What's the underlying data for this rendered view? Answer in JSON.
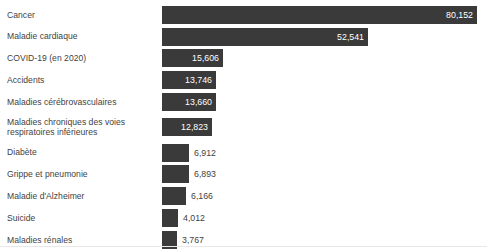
{
  "chart_data": {
    "type": "bar",
    "orientation": "horizontal",
    "title": "",
    "subtitle": "",
    "xlabel": "",
    "ylabel": "",
    "grid": false,
    "legend": null,
    "xlim": [
      0,
      80152
    ],
    "value_format": "comma-separated thousands",
    "bar_color": "#3a3a3a",
    "label_color": "#3f3f3f",
    "inside_label_color": "#ffffff",
    "categories": [
      "Cancer",
      "Maladie cardiaque",
      "COVID-19 (en 2020)",
      "Accidents",
      "Maladies cérébrovasculaires",
      "Maladies chroniques des voies\nrespiratoires inférieures",
      "Diabète",
      "Grippe et pneumonie",
      "Maladie d'Alzheimer",
      "Suicide",
      "Maladies rénales"
    ],
    "values": [
      80152,
      52541,
      15606,
      13746,
      13660,
      12823,
      6912,
      6893,
      6166,
      4012,
      3767
    ],
    "value_labels": [
      "80,152",
      "52,541",
      "15,606",
      "13,746",
      "13,660",
      "12,823",
      "6,912",
      "6,893",
      "6,166",
      "4,012",
      "3,767"
    ],
    "label_placement": [
      "inside",
      "inside",
      "inside",
      "inside",
      "inside",
      "inside",
      "outside",
      "outside",
      "outside",
      "outside",
      "outside"
    ]
  },
  "rows": [
    {
      "label": "Cancer",
      "value_label": "80,152",
      "value": 80152,
      "placement": "inside"
    },
    {
      "label": "Maladie cardiaque",
      "value_label": "52,541",
      "value": 52541,
      "placement": "inside"
    },
    {
      "label": "COVID-19 (en 2020)",
      "value_label": "15,606",
      "value": 15606,
      "placement": "inside"
    },
    {
      "label": "Accidents",
      "value_label": "13,746",
      "value": 13746,
      "placement": "inside"
    },
    {
      "label": "Maladies cérébrovasculaires",
      "value_label": "13,660",
      "value": 13660,
      "placement": "inside"
    },
    {
      "label": "Maladies chroniques des voies\nrespiratoires inférieures",
      "value_label": "12,823",
      "value": 12823,
      "placement": "inside"
    },
    {
      "label": "Diabète",
      "value_label": "6,912",
      "value": 6912,
      "placement": "outside"
    },
    {
      "label": "Grippe et pneumonie",
      "value_label": "6,893",
      "value": 6893,
      "placement": "outside"
    },
    {
      "label": "Maladie d'Alzheimer",
      "value_label": "6,166",
      "value": 6166,
      "placement": "outside"
    },
    {
      "label": "Suicide",
      "value_label": "4,012",
      "value": 4012,
      "placement": "outside"
    },
    {
      "label": "Maladies rénales",
      "value_label": "3,767",
      "value": 3767,
      "placement": "outside"
    }
  ]
}
